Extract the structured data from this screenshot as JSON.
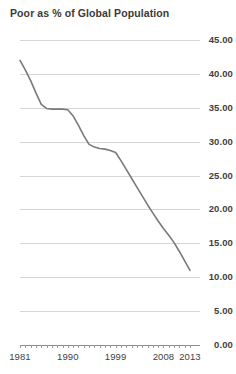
{
  "chart_title": "Poor as % of Global Population",
  "chart_data": {
    "type": "line",
    "title": "Poor as % of Global Population",
    "xlabel": "",
    "ylabel": "",
    "grid": true,
    "legend": "none",
    "xlim": [
      1981,
      2013
    ],
    "ylim": [
      0.0,
      45.0
    ],
    "ytick_labels": [
      "45.00",
      "40.00",
      "35.00",
      "30.00",
      "25.00",
      "20.00",
      "15.00",
      "10.00",
      "5.00",
      "0.00"
    ],
    "ytick_values": [
      45.0,
      40.0,
      35.0,
      30.0,
      25.0,
      20.0,
      15.0,
      10.0,
      5.0,
      0.0
    ],
    "xtick_labels": [
      "1981",
      "1990",
      "1999",
      "2008",
      "2013"
    ],
    "xtick_values": [
      1981,
      1990,
      1999,
      2008,
      2013
    ],
    "line_color": "#7a7a7a",
    "grid_color": "#d6d6d6",
    "axis_color": "#8c8c8c",
    "series": [
      {
        "name": "Poor as % of Global Population",
        "x": [
          1981,
          1982,
          1983,
          1984,
          1985,
          1986,
          1987,
          1988,
          1989,
          1990,
          1991,
          1992,
          1993,
          1994,
          1995,
          1996,
          1997,
          1998,
          1999,
          2000,
          2001,
          2002,
          2003,
          2004,
          2005,
          2006,
          2007,
          2008,
          2009,
          2010,
          2011,
          2012,
          2013
        ],
        "values": [
          42.0,
          40.6,
          39.0,
          37.2,
          35.5,
          34.9,
          34.8,
          34.8,
          34.8,
          34.7,
          33.8,
          32.4,
          30.9,
          29.6,
          29.2,
          29.0,
          28.9,
          28.7,
          28.4,
          27.2,
          25.9,
          24.6,
          23.3,
          22.0,
          20.7,
          19.5,
          18.3,
          17.2,
          16.2,
          15.1,
          13.8,
          12.4,
          11.0
        ]
      }
    ]
  }
}
